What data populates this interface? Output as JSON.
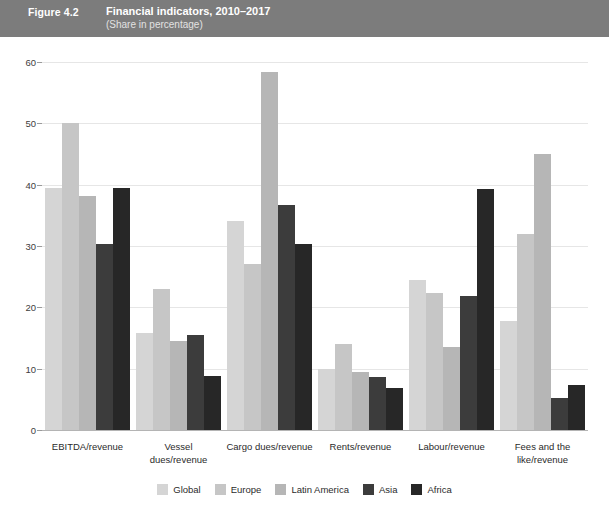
{
  "header": {
    "figure_number": "Figure 4.2",
    "title": "Financial indicators, 2010–2017",
    "subtitle": "(Share in percentage)",
    "band_color": "#7c7c7c"
  },
  "chart_data": {
    "type": "bar",
    "title": "Financial indicators, 2010–2017",
    "subtitle": "(Share in percentage)",
    "xlabel": "",
    "ylabel": "",
    "ylim": [
      0,
      60
    ],
    "yticks": [
      0,
      10,
      20,
      30,
      40,
      50,
      60
    ],
    "ytick_labels": [
      "0",
      "10",
      "20",
      "30",
      "40",
      "50",
      "60"
    ],
    "grid": true,
    "legend_position": "bottom",
    "categories": [
      "EBITDA/revenue",
      "Vessel\ndues/revenue",
      "Cargo dues/revenue",
      "Rents/revenue",
      "Labour/revenue",
      "Fees and the\nlike/revenue"
    ],
    "series": [
      {
        "name": "Global",
        "color": "#d5d5d5",
        "values": [
          39.4,
          15.8,
          34.0,
          10.0,
          24.5,
          17.8
        ]
      },
      {
        "name": "Europe",
        "color": "#c6c6c6",
        "values": [
          50.0,
          23.0,
          27.1,
          14.0,
          22.3,
          32.0
        ]
      },
      {
        "name": "Latin America",
        "color": "#b6b6b6",
        "values": [
          38.1,
          14.5,
          58.4,
          9.4,
          13.6,
          45.0
        ]
      },
      {
        "name": "Asia",
        "color": "#3c3c3c",
        "values": [
          30.4,
          15.5,
          36.7,
          8.7,
          21.8,
          5.2
        ]
      },
      {
        "name": "Africa",
        "color": "#272727",
        "values": [
          39.5,
          8.8,
          30.3,
          6.9,
          39.3,
          7.4
        ]
      }
    ]
  },
  "legend": {
    "items": [
      {
        "label": "Global",
        "color": "#d5d5d5"
      },
      {
        "label": "Europe",
        "color": "#c6c6c6"
      },
      {
        "label": "Latin America",
        "color": "#b6b6b6"
      },
      {
        "label": "Asia",
        "color": "#3c3c3c"
      },
      {
        "label": "Africa",
        "color": "#272727"
      }
    ]
  }
}
